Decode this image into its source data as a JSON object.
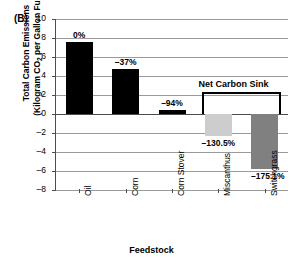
{
  "panel": {
    "label": "(B)"
  },
  "chart_data": {
    "type": "bar",
    "title": "",
    "panel_label": "(B)",
    "xlabel": "Feedstock",
    "ylabel": "Total Carbon Emissions (Kilogram CO2 per Gallon Fuel)",
    "ylabel_line1": "Total Carbon Emissions",
    "ylabel_line2_pre": "(Kilogram  CO",
    "ylabel_line2_sub": "2",
    "ylabel_line2_post": " per Gallon Fuel)",
    "ylim": [
      -8,
      10
    ],
    "ytick_step": 2,
    "yticks": [
      "10",
      "8",
      "6",
      "4",
      "2",
      "0",
      "–2",
      "–4",
      "–6",
      "–8"
    ],
    "ytick_values": [
      10,
      8,
      6,
      4,
      2,
      0,
      -2,
      -4,
      -6,
      -8
    ],
    "grid": true,
    "legend": "none",
    "categories": [
      "Oil",
      "Corn",
      "Corn Stover",
      "Miscanthus",
      "Switchgrass"
    ],
    "values": [
      7.6,
      4.75,
      0.45,
      -2.3,
      -5.75
    ],
    "data_labels": [
      "0%",
      "–37%",
      "–94%",
      "–130.5%",
      "–175.1%"
    ],
    "bar_colors": [
      "#000000",
      "#000000",
      "#000000",
      "#cdcdcd",
      "#808080"
    ],
    "annotations": [
      {
        "text": "Net Carbon Sink",
        "spans": [
          "Miscanthus",
          "Switchgrass"
        ],
        "style": "bracket"
      }
    ]
  }
}
